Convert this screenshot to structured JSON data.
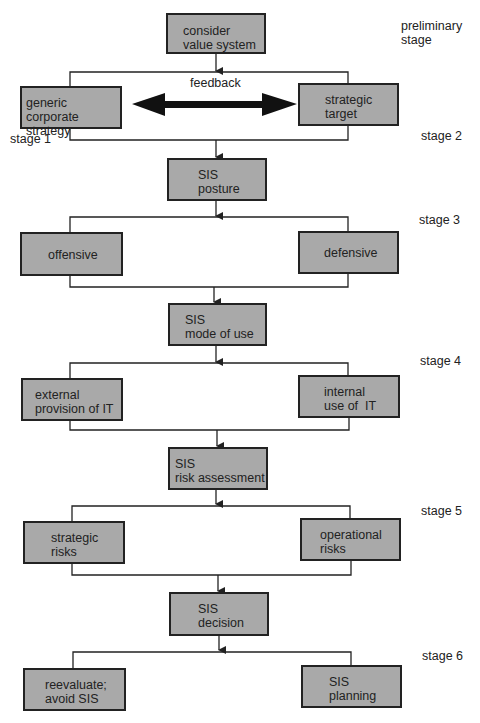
{
  "diagram": {
    "type": "flowchart",
    "colors": {
      "box_fill": "#a9a9a9",
      "border": "#222222",
      "background": "#ffffff"
    },
    "nodes": [
      {
        "id": "value",
        "lines": [
          "consider",
          "value system"
        ]
      },
      {
        "id": "generic",
        "lines": [
          "generic corporate",
          "strategy"
        ]
      },
      {
        "id": "target",
        "lines": [
          "strategic",
          "target"
        ]
      },
      {
        "id": "posture",
        "lines": [
          "SIS",
          "posture"
        ]
      },
      {
        "id": "offensive",
        "lines": [
          "offensive"
        ]
      },
      {
        "id": "defensive",
        "lines": [
          "defensive"
        ]
      },
      {
        "id": "mode",
        "lines": [
          "SIS",
          "mode of use"
        ]
      },
      {
        "id": "external",
        "lines": [
          "external",
          "provision of IT"
        ]
      },
      {
        "id": "internal",
        "lines": [
          "internal",
          "use of  IT"
        ]
      },
      {
        "id": "risk",
        "lines": [
          "SIS",
          "risk assessment"
        ]
      },
      {
        "id": "strategic_risks",
        "lines": [
          "strategic",
          "risks"
        ]
      },
      {
        "id": "operational_risks",
        "lines": [
          "operational",
          "risks"
        ]
      },
      {
        "id": "decision",
        "lines": [
          "SIS",
          "decision"
        ]
      },
      {
        "id": "reevaluate",
        "lines": [
          "reevaluate;",
          "avoid SIS"
        ]
      },
      {
        "id": "planning",
        "lines": [
          "SIS",
          "planning"
        ]
      }
    ],
    "feedback_label": "feedback",
    "stages": {
      "preliminary": [
        "preliminary",
        "stage"
      ],
      "s1": "stage 1",
      "s2": "stage 2",
      "s3": "stage 3",
      "s4": "stage 4",
      "s5": "stage 5",
      "s6": "stage 6"
    }
  }
}
